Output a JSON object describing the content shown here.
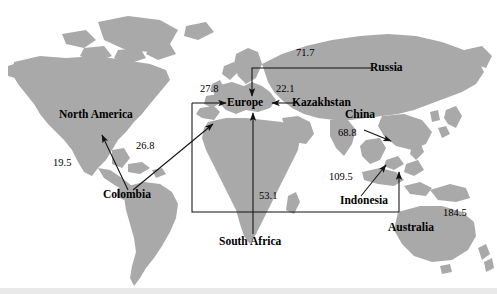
{
  "figure": {
    "type": "world-map-flow-diagram",
    "background_color": "#ffffff",
    "land_color": "#a8a8a8",
    "line_color": "#1a1a1a",
    "text_color": "#000000"
  },
  "nodes": [
    {
      "id": "north-america",
      "label": "North America",
      "x": 106,
      "y": 116
    },
    {
      "id": "colombia",
      "label": "Colombia",
      "x": 131,
      "y": 196
    },
    {
      "id": "europe",
      "label": "Europe",
      "x": 248,
      "y": 103
    },
    {
      "id": "russia",
      "label": "Russia",
      "x": 389,
      "y": 68
    },
    {
      "id": "kazakhstan",
      "label": "Kazakhstan",
      "x": 324,
      "y": 104
    },
    {
      "id": "china",
      "label": "China",
      "x": 362,
      "y": 115
    },
    {
      "id": "indonesia",
      "label": "Indonesia",
      "x": 366,
      "y": 201
    },
    {
      "id": "australia",
      "label": "Australia",
      "x": 414,
      "y": 228
    },
    {
      "id": "south-africa",
      "label": "South Africa",
      "x": 253,
      "y": 242
    }
  ],
  "flows": [
    {
      "id": "colombia-to-north-america",
      "value": "19.5",
      "from": "colombia",
      "to": "north-america",
      "label_x": 64,
      "label_y": 163
    },
    {
      "id": "colombia-to-europe",
      "value": "26.8",
      "from": "colombia",
      "to": "europe",
      "label_x": 147,
      "label_y": 146
    },
    {
      "id": "australia-to-europe",
      "value": "27.8",
      "from": "australia",
      "to": "europe",
      "label_x": 211,
      "label_y": 89
    },
    {
      "id": "kazakhstan-to-europe",
      "value": "22.1",
      "from": "kazakhstan",
      "to": "europe",
      "label_x": 285,
      "label_y": 89
    },
    {
      "id": "russia-to-europe",
      "value": "71.7",
      "from": "russia",
      "to": "europe",
      "label_x": 307,
      "label_y": 53
    },
    {
      "id": "south-africa-to-europe",
      "value": "53.1",
      "from": "south-africa",
      "to": "europe",
      "label_x": 270,
      "label_y": 196
    },
    {
      "id": "china-export",
      "value": "68.8",
      "from": "china",
      "to": "china-coast",
      "label_x": 350,
      "label_y": 133
    },
    {
      "id": "indonesia-export",
      "value": "109.5",
      "from": "indonesia",
      "to": "philippines",
      "label_x": 344,
      "label_y": 177
    },
    {
      "id": "australia-export",
      "value": "184.5",
      "from": "australia",
      "to": "indonesia",
      "label_x": 455,
      "label_y": 213
    }
  ]
}
